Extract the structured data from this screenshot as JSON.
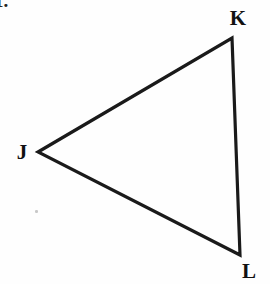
{
  "figure": {
    "kind": "geometry-diagram",
    "width": 270,
    "height": 284,
    "background_color": "#fefefe",
    "stroke_color": "#1a1a1a",
    "stroke_width": 3.2,
    "label_color": "#111111"
  },
  "item_number": {
    "text": "1.",
    "x": 2,
    "y": 2,
    "clipped": true
  },
  "shape": {
    "name": "triangle-jkl",
    "closed": true,
    "vertices": [
      {
        "id": "J",
        "x": 38,
        "y": 152
      },
      {
        "id": "K",
        "x": 232,
        "y": 38
      },
      {
        "id": "L",
        "x": 240,
        "y": 255
      }
    ],
    "points_attr": "38,152 232,38 240,255",
    "edges": [
      {
        "from": "J",
        "to": "K"
      },
      {
        "from": "K",
        "to": "L"
      },
      {
        "from": "L",
        "to": "J"
      }
    ]
  },
  "labels": [
    {
      "id": "label-j",
      "text": "J",
      "x": 22,
      "y": 152
    },
    {
      "id": "label-k",
      "text": "K",
      "x": 238,
      "y": 18
    },
    {
      "id": "label-l",
      "text": "L",
      "x": 249,
      "y": 271
    }
  ],
  "specks": [
    {
      "x": 35,
      "y": 210,
      "size": 2.5
    },
    {
      "x": 14,
      "y": 11,
      "size": 2.2
    }
  ]
}
